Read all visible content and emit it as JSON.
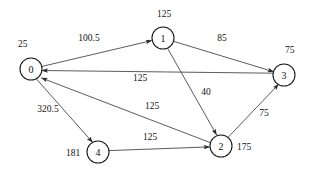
{
  "diagram": {
    "width": 309,
    "height": 169,
    "background_color": "#ffffff",
    "node_stroke_color": "#1a1a1a",
    "edge_stroke_color": "#4a4a4a",
    "text_color": "#111111"
  },
  "nodes": [
    {
      "id": "0",
      "label": "0",
      "weight": "25",
      "cx": 31,
      "cy": 69,
      "r": 11,
      "weight_x": 18,
      "weight_y": 47
    },
    {
      "id": "1",
      "label": "1",
      "weight": "125",
      "cx": 163,
      "cy": 38,
      "r": 11,
      "weight_x": 157,
      "weight_y": 17
    },
    {
      "id": "2",
      "label": "2",
      "weight": "175",
      "cx": 221,
      "cy": 146,
      "r": 11,
      "weight_x": 237,
      "weight_y": 150
    },
    {
      "id": "3",
      "label": "3",
      "weight": "75",
      "cx": 284,
      "cy": 75,
      "r": 11,
      "weight_x": 285,
      "weight_y": 53
    },
    {
      "id": "4",
      "label": "4",
      "weight": "181",
      "cx": 98,
      "cy": 152,
      "r": 11,
      "weight_x": 66,
      "weight_y": 156
    }
  ],
  "edges": [
    {
      "from": "0",
      "to": "1",
      "weight": "100.5",
      "label_x": 89,
      "label_y": 41
    },
    {
      "from": "1",
      "to": "3",
      "weight": "85",
      "label_x": 222,
      "label_y": 41
    },
    {
      "from": "3",
      "to": "0",
      "weight": "125",
      "label_x": 140,
      "label_y": 81
    },
    {
      "from": "1",
      "to": "2",
      "weight": "40",
      "label_x": 206,
      "label_y": 95
    },
    {
      "from": "2",
      "to": "3",
      "weight": "75",
      "label_x": 264,
      "label_y": 116
    },
    {
      "from": "0",
      "to": "4",
      "weight": "320.5",
      "label_x": 48,
      "label_y": 112
    },
    {
      "from": "2",
      "to": "0",
      "weight": "125",
      "label_x": 152,
      "label_y": 109
    },
    {
      "from": "4",
      "to": "2",
      "weight": "125",
      "label_x": 150,
      "label_y": 140
    }
  ]
}
